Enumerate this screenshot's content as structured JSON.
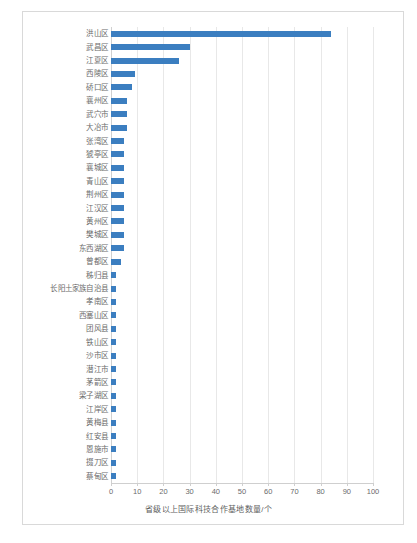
{
  "chart_data": {
    "type": "bar",
    "orientation": "horizontal",
    "title": "",
    "xlabel": "省级以上国际科技合作基地数量/个",
    "ylabel": "",
    "xlim": [
      0,
      100
    ],
    "xticks": [
      0,
      10,
      20,
      30,
      40,
      50,
      60,
      70,
      80,
      90,
      100
    ],
    "xtick_labels": [
      "0",
      "10",
      "20",
      "30",
      "40",
      "50",
      "60",
      "70",
      "80",
      "90",
      "100"
    ],
    "grid": true,
    "legend": false,
    "bar_color": "#3b7ec0",
    "categories": [
      "洪山区",
      "武昌区",
      "江夏区",
      "西陵区",
      "硚口区",
      "襄州区",
      "武穴市",
      "大冶市",
      "张湾区",
      "猇亭区",
      "襄城区",
      "青山区",
      "荆州区",
      "江汉区",
      "黄州区",
      "樊城区",
      "东西湖区",
      "曾都区",
      "秭归县",
      "长阳土家族自治县",
      "孝南区",
      "西塞山区",
      "团风县",
      "铁山区",
      "沙市区",
      "潜江市",
      "茅箭区",
      "梁子湖区",
      "江岸区",
      "黄梅县",
      "红安县",
      "恩施市",
      "掇刀区",
      "蔡甸区"
    ],
    "values": [
      84,
      30,
      26,
      9,
      8,
      6,
      6,
      6,
      5,
      5,
      5,
      5,
      5,
      5,
      5,
      5,
      5,
      4,
      2,
      2,
      2,
      2,
      2,
      2,
      2,
      2,
      2,
      2,
      2,
      2,
      2,
      2,
      2,
      2
    ]
  }
}
